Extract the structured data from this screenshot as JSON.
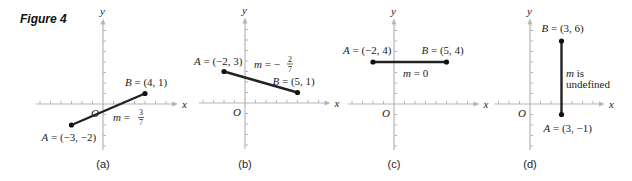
{
  "figure": {
    "title": "Figure 4",
    "axis_color": "#b5b5b5",
    "segment_color": "#222222",
    "tick_spacing_px": 10.5,
    "panels": [
      {
        "id": "a",
        "caption": "(a)",
        "origin_px": [
          103,
          104
        ],
        "x_range": [
          -6,
          6
        ],
        "y_range": [
          -4,
          7
        ],
        "axis_labels": {
          "x": "x",
          "y": "y",
          "origin": "O"
        },
        "A": {
          "label": "A = (−3, −2)",
          "x": -3,
          "y": -2
        },
        "B": {
          "label": "B = (4, 1)",
          "x": 4,
          "y": 1
        },
        "slope_label": "m = 3/7",
        "slope": {
          "prefix": "m = ",
          "num": "3",
          "den": "7"
        }
      },
      {
        "id": "b",
        "caption": "(b)",
        "origin_px": [
          245,
          103
        ],
        "x_range": [
          -4,
          7
        ],
        "y_range": [
          -4,
          7
        ],
        "axis_labels": {
          "x": "x",
          "y": "y",
          "origin": "O"
        },
        "A": {
          "label": "A = (−2, 3)",
          "x": -2,
          "y": 3
        },
        "B": {
          "label": "B = (5, 1)",
          "x": 5,
          "y": 1
        },
        "slope_label": "m = −2/7",
        "slope": {
          "prefix": "m = −",
          "num": "2",
          "den": "7"
        }
      },
      {
        "id": "c",
        "caption": "(c)",
        "origin_px": [
          394,
          104
        ],
        "x_range": [
          -4,
          7
        ],
        "y_range": [
          -4,
          7
        ],
        "axis_labels": {
          "x": "x",
          "y": "y",
          "origin": "O"
        },
        "A": {
          "label": "A = (−2, 4)",
          "x": -2,
          "y": 4
        },
        "B": {
          "label": "B = (5, 4)",
          "x": 5,
          "y": 4
        },
        "slope_label": "m = 0"
      },
      {
        "id": "d",
        "caption": "(d)",
        "origin_px": [
          530,
          104
        ],
        "x_range": [
          -3,
          6
        ],
        "y_range": [
          -4,
          7
        ],
        "axis_labels": {
          "x": "x",
          "y": "y",
          "origin": "O"
        },
        "A": {
          "label": "A = (3, −1)",
          "x": 3,
          "y": -1
        },
        "B": {
          "label": "B = (3, 6)",
          "x": 3,
          "y": 6
        },
        "slope_label_lines": [
          "m is",
          "undefined"
        ]
      }
    ]
  }
}
